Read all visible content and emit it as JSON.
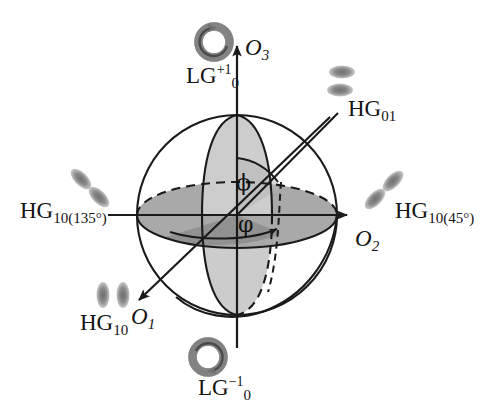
{
  "figure": {
    "name": "higher-order-poincare-sphere",
    "background_color": "#ffffff",
    "line_color": "#1a1a1a",
    "width": 494,
    "height": 416
  },
  "axes": [
    {
      "id": "o1",
      "label_base": "O",
      "label_sub": "1",
      "direction": "front-lower-left",
      "x": 131,
      "y": 305
    },
    {
      "id": "o2",
      "label_base": "O",
      "label_sub": "2",
      "direction": "right",
      "x": 355,
      "y": 227
    },
    {
      "id": "o3",
      "label_base": "O",
      "label_sub": "3",
      "direction": "up",
      "x": 245,
      "y": 36
    }
  ],
  "angles": [
    {
      "id": "phi-polar",
      "symbol": "ϕ",
      "x": 236,
      "y": 172
    },
    {
      "id": "varphi-azimuth",
      "symbol": "φ",
      "x": 238,
      "y": 214
    }
  ],
  "mode_labels": [
    {
      "id": "lg-plus-one",
      "base": "LG",
      "sub": "0",
      "sup": "+1",
      "x": 186,
      "y": 64,
      "icon": "vortex-ring-ccw"
    },
    {
      "id": "lg-minus-one",
      "base": "LG",
      "sub": "0",
      "sup": "−1",
      "x": 198,
      "y": 376,
      "icon": "vortex-ring-cw"
    },
    {
      "id": "hg-01",
      "base": "HG",
      "sub": "01",
      "sup": "",
      "x": 348,
      "y": 97,
      "icon": "two-lobes-vertical-stack"
    },
    {
      "id": "hg-10",
      "base": "HG",
      "sub": "10",
      "sup": "",
      "x": 80,
      "y": 311,
      "icon": "two-lobes-horizontal-pair"
    },
    {
      "id": "hg-10-45",
      "base": "HG",
      "sub": "10(45°)",
      "sup": "",
      "x": 395,
      "y": 199,
      "icon": "two-lobes-diagonal-45"
    },
    {
      "id": "hg-10-135",
      "base": "HG",
      "sub": "10(135°)",
      "sup": "",
      "x": 20,
      "y": 199,
      "icon": "two-lobes-diagonal-135"
    }
  ],
  "sphere": {
    "center_x": 237,
    "center_y": 215,
    "radius": 100,
    "equator_fill": "#a8a8a8",
    "meridian_fill": "#c9c9c9",
    "azimuth_wedge_fill": "#9a9a9a",
    "outline_color": "#1a1a1a"
  },
  "beam_icons": {
    "lobe_color": "#8d8d8d",
    "ring_color": "#9a9a9a"
  }
}
